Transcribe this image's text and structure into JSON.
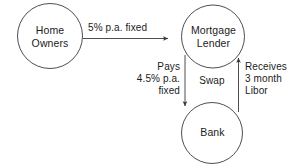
{
  "diagram": {
    "colors": {
      "stroke": "#3a3a3a",
      "text": "#1b1b1b",
      "background": "#ffffff"
    },
    "nodes": [
      {
        "id": "home-owners",
        "label": "Home\nOwners",
        "shape": "circle",
        "cx": 50,
        "cy": 36,
        "r": 32
      },
      {
        "id": "mortgage-lender",
        "label": "Mortgage\nLender",
        "shape": "circle",
        "cx": 213,
        "cy": 36,
        "r": 31
      },
      {
        "id": "bank",
        "label": "Bank",
        "shape": "circle",
        "cx": 212,
        "cy": 133,
        "r": 31
      }
    ],
    "edges": [
      {
        "id": "home-owners-to-mortgage-lender",
        "from": "home-owners",
        "to": "mortgage-lender",
        "label": "5% p.a. fixed",
        "direction": "right"
      },
      {
        "id": "mortgage-lender-to-bank",
        "from": "mortgage-lender",
        "to": "bank",
        "label": "Pays\n4.5% p.a.\nfixed",
        "direction": "down"
      },
      {
        "id": "bank-to-mortgage-lender",
        "from": "bank",
        "to": "mortgage-lender",
        "label": "Receives\n3 month\nLibor",
        "direction": "up"
      }
    ],
    "annotations": [
      {
        "id": "swap",
        "label": "Swap"
      }
    ]
  }
}
